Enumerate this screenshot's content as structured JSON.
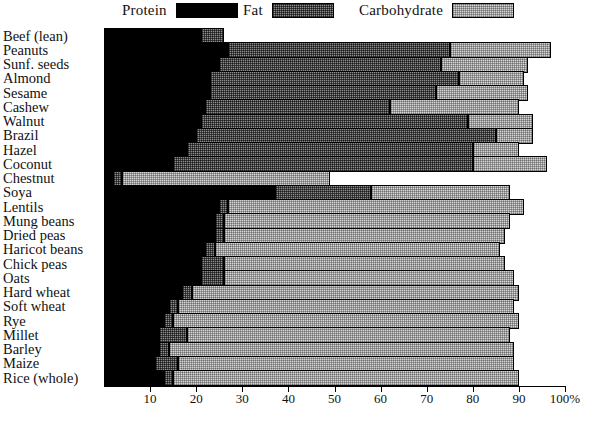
{
  "legend": {
    "items": [
      {
        "name": "protein",
        "label": "Protein",
        "color": "#000000"
      },
      {
        "name": "fat",
        "label": "Fat",
        "color": "#8d8d8d"
      },
      {
        "name": "carbohydrate",
        "label": "Carbohydrate",
        "color": "#d6d6d6"
      }
    ]
  },
  "axis": {
    "ticks": [
      "10",
      "20",
      "30",
      "40",
      "50",
      "60",
      "70",
      "80",
      "90",
      "100%"
    ],
    "tick_values": [
      10,
      20,
      30,
      40,
      50,
      60,
      70,
      80,
      90,
      100
    ],
    "min": 0,
    "max": 100
  },
  "chart_data": {
    "type": "bar",
    "orientation": "horizontal",
    "stacked": true,
    "title": "",
    "subtitle": "",
    "xlabel": "",
    "ylabel": "",
    "xlim": [
      0,
      100
    ],
    "grid": false,
    "legend_position": "top",
    "categories": [
      "Beef (lean)",
      "Peanuts",
      "Sunf. seeds",
      "Almond",
      "Sesame",
      "Cashew",
      "Walnut",
      "Brazil",
      "Hazel",
      "Coconut",
      "Chestnut",
      "Soya",
      "Lentils",
      "Mung beans",
      "Dried peas",
      "Haricot beans",
      "Chick peas",
      "Oats",
      "Hard wheat",
      "Soft wheat",
      "Rye",
      "Millet",
      "Barley",
      "Maize",
      "Rice (whole)"
    ],
    "series": [
      {
        "name": "Protein",
        "color": "#000000",
        "values": [
          21,
          27,
          25,
          23,
          23,
          22,
          21,
          20,
          18,
          15,
          2,
          37,
          25,
          24,
          24,
          22,
          21,
          21,
          17,
          14,
          13,
          12,
          12,
          11,
          13
        ]
      },
      {
        "name": "Fat",
        "color": "#8d8d8d",
        "values": [
          26,
          75,
          73,
          77,
          72,
          62,
          79,
          85,
          80,
          80,
          4,
          58,
          27,
          26,
          26,
          24,
          26,
          26,
          19,
          16,
          15,
          18,
          14,
          16,
          15
        ]
      },
      {
        "name": "Carbohydrate",
        "color": "#d6d6d6",
        "values": [
          26,
          97,
          92,
          91,
          92,
          90,
          93,
          93,
          90,
          96,
          49,
          88,
          91,
          88,
          87,
          86,
          87,
          89,
          90,
          89,
          90,
          88,
          89,
          89,
          90
        ]
      }
    ],
    "note": "Series values are cumulative stack end-points in percent; Fat segment spans Protein-end to Fat-end, Carbohydrate spans Fat-end to Carbohydrate-end."
  }
}
